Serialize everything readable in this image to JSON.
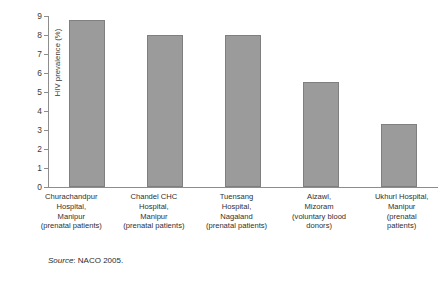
{
  "chart_data": {
    "type": "bar",
    "title": "",
    "xlabel": "",
    "ylabel": "HIV prevalence (%)",
    "ylim": [
      0,
      9
    ],
    "yticks": [
      0,
      1,
      2,
      3,
      4,
      5,
      6,
      7,
      8,
      9
    ],
    "ytick_labels": [
      "0",
      "1",
      "2",
      "3",
      "4",
      "5",
      "6",
      "7",
      "8",
      "9"
    ],
    "grid": false,
    "legend": null,
    "bar_color": "#9b9b9b",
    "bar_edge_color": "#7f7f7f",
    "axis_color": "#8d8d8d",
    "categories": [
      "Churachandpur Hospital, Manipur (prenatal patients)",
      "Chandel CHC Hospital, Manipur (prenatal patients)",
      "Tuensang Hospital, Nagaland (prenatal patients)",
      "Aizawl, Mizoram (voluntary blood donors)",
      "Ukhurl Hospital, Manipur (prenatal patients)"
    ],
    "category_lines": [
      [
        "Churachandpur",
        "Hospital,",
        "Manipur",
        "(prenatal patients)"
      ],
      [
        "Chandel CHC",
        "Hospital,",
        "Manipur",
        "(prenatal patients)"
      ],
      [
        "Tuensang",
        "Hospital,",
        "Nagaland",
        "(prenatal patients)"
      ],
      [
        "Aizawl,",
        "Mizoram",
        "(voluntary blood",
        "donors)"
      ],
      [
        "Ukhurl Hospital,",
        "Manipur",
        "(prenatal",
        "patients)"
      ]
    ],
    "values": [
      8.8,
      8.0,
      8.0,
      5.55,
      3.3
    ]
  },
  "source": {
    "label": "Source",
    "separator": ": ",
    "text": "NACO 2005."
  }
}
